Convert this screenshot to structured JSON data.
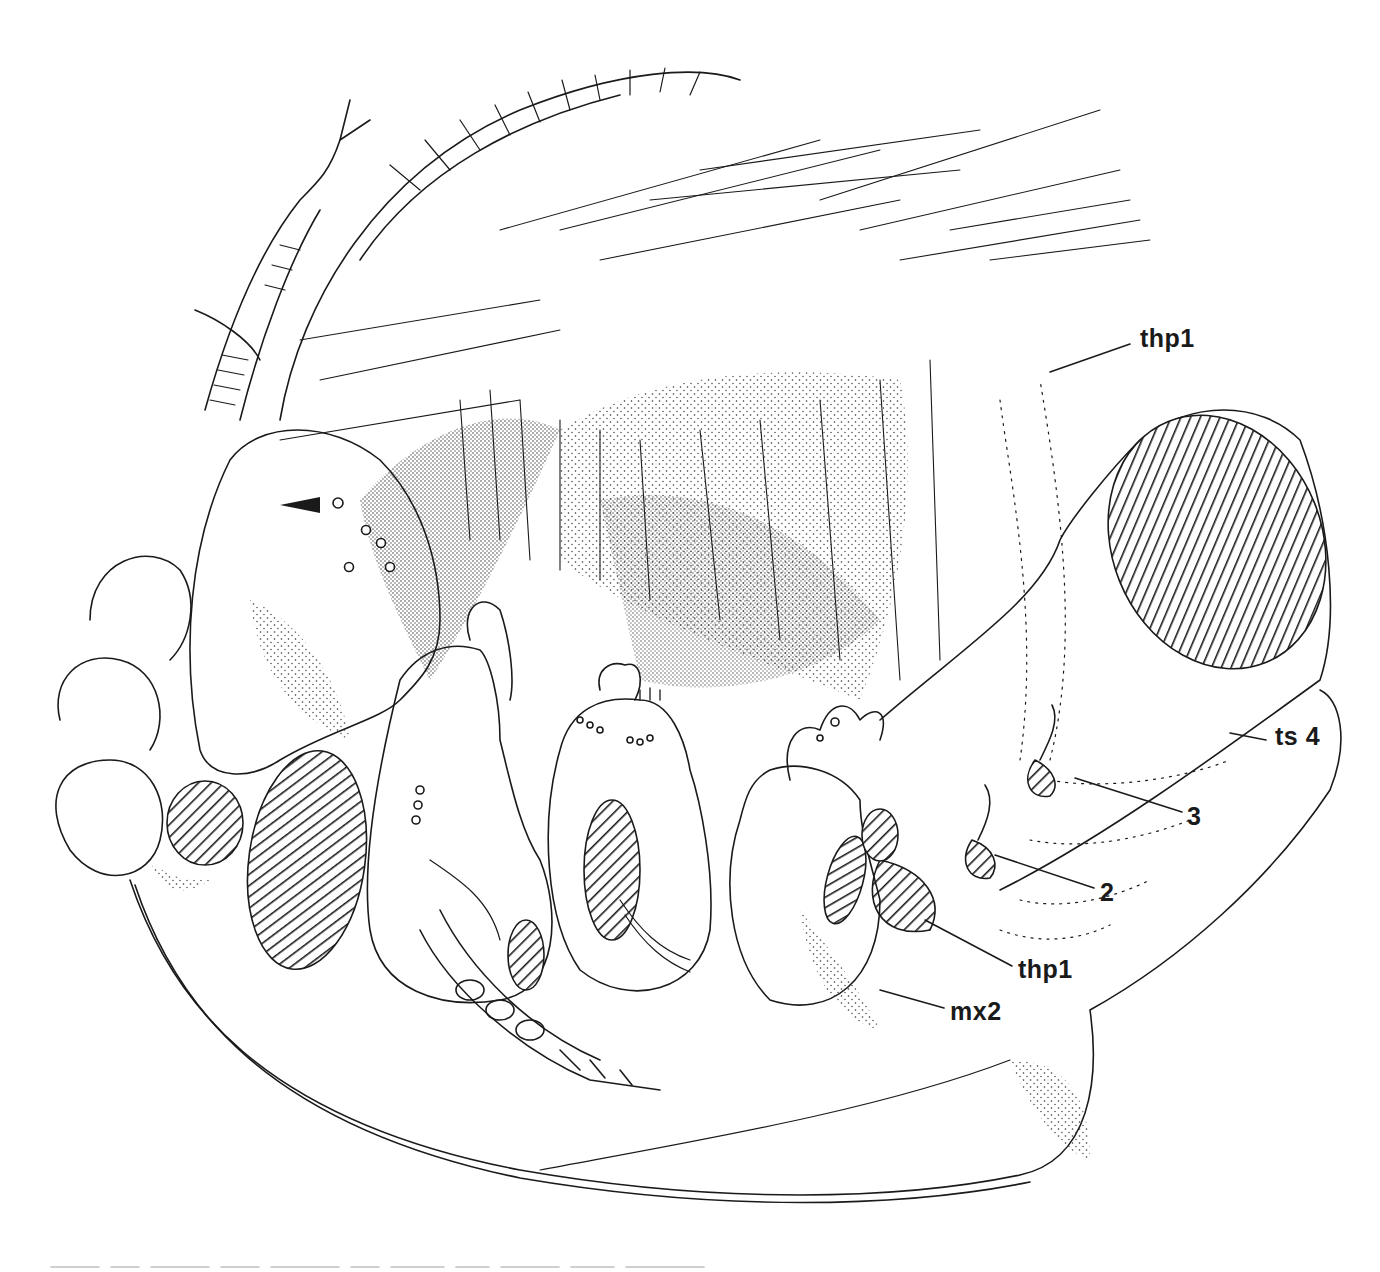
{
  "figure": {
    "stroke_color": "#1a1a1a",
    "background": "#ffffff",
    "labels": [
      {
        "id": "thp1-top",
        "text": "thp1",
        "x": 1140,
        "y": 339
      },
      {
        "id": "ts4",
        "text": "ts 4",
        "x": 1275,
        "y": 736
      },
      {
        "id": "num-3",
        "text": "3",
        "x": 1187,
        "y": 817
      },
      {
        "id": "num-2",
        "text": "2",
        "x": 1100,
        "y": 893
      },
      {
        "id": "thp1-bottom",
        "text": "thp1",
        "x": 1018,
        "y": 970
      },
      {
        "id": "mx2",
        "text": "mx2",
        "x": 950,
        "y": 1010
      }
    ],
    "arrowhead": {
      "x": 278,
      "y": 505,
      "points_to": "pore"
    }
  }
}
